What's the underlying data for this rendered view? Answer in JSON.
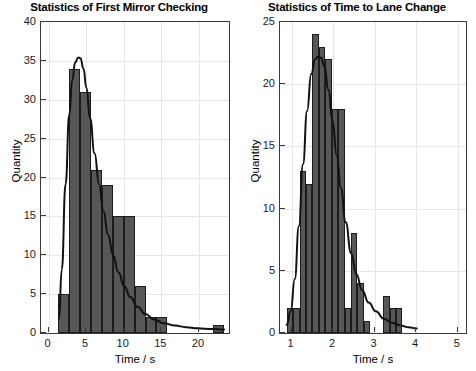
{
  "figure": {
    "background": "#ffffff",
    "bar_fill": "#575757",
    "bar_edge": "#1c1c1c",
    "curve_color": "#111111",
    "grid_color": "#e6e6e6",
    "axis_color": "#3a3a3a"
  },
  "chart_data": [
    {
      "type": "bar",
      "id": "first-mirror-checking",
      "title": "Statistics of First Mirror Checking",
      "xlabel": "Time / s",
      "ylabel": "Quantity",
      "xlim": [
        -1.0,
        24.0
      ],
      "ylim": [
        0,
        40
      ],
      "xticks": [
        0,
        5,
        10,
        15,
        20
      ],
      "yticks": [
        0,
        5,
        10,
        15,
        20,
        25,
        30,
        35,
        40
      ],
      "grid": true,
      "bin_width": 1.45,
      "bin_edges": [
        1.3,
        2.75,
        4.2,
        5.65,
        7.1,
        8.55,
        10.0,
        11.45,
        12.9,
        14.35,
        21.9,
        23.35
      ],
      "bins": [
        {
          "x0": 1.3,
          "x1": 2.75,
          "value": 5
        },
        {
          "x0": 2.75,
          "x1": 4.2,
          "value": 34
        },
        {
          "x0": 4.2,
          "x1": 5.65,
          "value": 31
        },
        {
          "x0": 5.65,
          "x1": 7.1,
          "value": 21
        },
        {
          "x0": 7.1,
          "x1": 8.55,
          "value": 19
        },
        {
          "x0": 8.55,
          "x1": 10.0,
          "value": 15
        },
        {
          "x0": 10.0,
          "x1": 11.45,
          "value": 15
        },
        {
          "x0": 11.45,
          "x1": 12.9,
          "value": 6
        },
        {
          "x0": 12.9,
          "x1": 14.35,
          "value": 2
        },
        {
          "x0": 14.35,
          "x1": 15.8,
          "value": 2
        },
        {
          "x0": 21.9,
          "x1": 23.35,
          "value": 1
        }
      ],
      "fit_curve": {
        "name": "lognormal-fit",
        "peak_x": 4.3,
        "peak_y": 35.4,
        "points_x": [
          1.4,
          1.8,
          2.3,
          2.8,
          3.2,
          3.6,
          4.0,
          4.3,
          4.7,
          5.1,
          5.6,
          6.2,
          6.8,
          7.4,
          8.0,
          8.7,
          9.4,
          10.2,
          11.0,
          12.0,
          13.0,
          14.2,
          15.5,
          17.0,
          18.5,
          20.0,
          22.0,
          23.6
        ],
        "points_y": [
          1.5,
          8.0,
          19.0,
          28.0,
          32.5,
          34.8,
          35.4,
          35.3,
          34.0,
          31.5,
          27.5,
          23.0,
          19.0,
          15.5,
          12.5,
          9.8,
          7.6,
          5.8,
          4.4,
          3.1,
          2.2,
          1.5,
          1.0,
          0.7,
          0.5,
          0.35,
          0.25,
          0.2
        ]
      }
    },
    {
      "type": "bar",
      "id": "time-to-lane-change",
      "title": "Statistics of Time to Lane Change",
      "xlabel": "Time / s",
      "ylabel": "Quantity",
      "xlim": [
        0.72,
        5.2
      ],
      "ylim": [
        0,
        25
      ],
      "xticks": [
        1,
        2,
        3,
        4,
        5
      ],
      "yticks": [
        0,
        5,
        10,
        15,
        20,
        25
      ],
      "grid": true,
      "bin_width": 0.155,
      "bins": [
        {
          "x0": 0.88,
          "x1": 1.035,
          "value": 2
        },
        {
          "x0": 1.035,
          "x1": 1.19,
          "value": 2
        },
        {
          "x0": 1.19,
          "x1": 1.345,
          "value": 13
        },
        {
          "x0": 1.345,
          "x1": 1.5,
          "value": 12
        },
        {
          "x0": 1.5,
          "x1": 1.655,
          "value": 24
        },
        {
          "x0": 1.655,
          "x1": 1.81,
          "value": 23
        },
        {
          "x0": 1.81,
          "x1": 1.965,
          "value": 22
        },
        {
          "x0": 1.965,
          "x1": 2.12,
          "value": 18
        },
        {
          "x0": 2.12,
          "x1": 2.275,
          "value": 18
        },
        {
          "x0": 2.275,
          "x1": 2.43,
          "value": 2
        },
        {
          "x0": 2.43,
          "x1": 2.585,
          "value": 8
        },
        {
          "x0": 2.585,
          "x1": 2.74,
          "value": 4
        },
        {
          "x0": 2.74,
          "x1": 2.895,
          "value": 1
        },
        {
          "x0": 3.205,
          "x1": 3.36,
          "value": 3
        },
        {
          "x0": 3.36,
          "x1": 3.515,
          "value": 2
        },
        {
          "x0": 3.515,
          "x1": 3.67,
          "value": 2
        }
      ],
      "fit_curve": {
        "name": "lognormal-fit",
        "peak_x": 1.72,
        "peak_y": 22.2,
        "points_x": [
          0.88,
          0.98,
          1.08,
          1.18,
          1.28,
          1.38,
          1.48,
          1.58,
          1.65,
          1.72,
          1.8,
          1.9,
          2.0,
          2.1,
          2.2,
          2.32,
          2.45,
          2.58,
          2.72,
          2.88,
          3.05,
          3.25,
          3.45,
          3.65,
          3.85,
          4.05
        ],
        "points_y": [
          0.5,
          1.6,
          4.2,
          8.5,
          13.5,
          17.8,
          20.8,
          22.0,
          22.2,
          22.1,
          21.4,
          19.5,
          17.0,
          14.2,
          11.6,
          8.8,
          6.3,
          4.6,
          3.3,
          2.3,
          1.6,
          1.0,
          0.65,
          0.45,
          0.3,
          0.2
        ]
      }
    }
  ]
}
